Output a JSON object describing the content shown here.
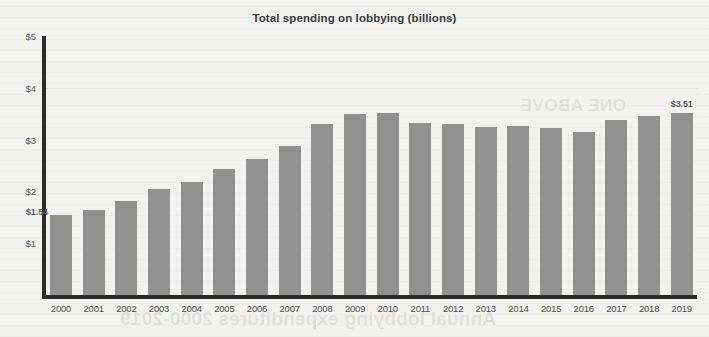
{
  "chart": {
    "title": "Total spending on lobbying (billions)",
    "background_color": "#f2f2f0",
    "bar_color": "#919191",
    "axis_color": "#2d2d2d",
    "label_color": "#5a5a5a"
  },
  "axes": {
    "y_ticks": [
      "$5",
      "$4",
      "$3",
      "$2",
      "$1"
    ],
    "x_ticks": [
      "2000",
      "2001",
      "2002",
      "2003",
      "2004",
      "2005",
      "2006",
      "2007",
      "2008",
      "2009",
      "2010",
      "2011",
      "2012",
      "2013",
      "2014",
      "2015",
      "2016",
      "2017",
      "2018",
      "2019"
    ]
  },
  "annotations": {
    "first_bar_label": "$1.54",
    "last_bar_label": "$3.51"
  },
  "background_text": {
    "heading": "Annual lobbying expenditures 2000-2019",
    "word": "ONE ABOVE"
  },
  "chart_data": {
    "type": "bar",
    "title": "Total spending on lobbying (billions)",
    "xlabel": "",
    "ylabel": "",
    "ylim": [
      0,
      5
    ],
    "yticks": [
      1,
      2,
      3,
      4,
      5
    ],
    "ytick_labels": [
      "$1",
      "$2",
      "$3",
      "$4",
      "$5"
    ],
    "grid": false,
    "legend": "none",
    "units": "billions of US dollars",
    "categories": [
      "2000",
      "2001",
      "2002",
      "2003",
      "2004",
      "2005",
      "2006",
      "2007",
      "2008",
      "2009",
      "2010",
      "2011",
      "2012",
      "2013",
      "2014",
      "2015",
      "2016",
      "2017",
      "2018",
      "2019"
    ],
    "values": [
      1.54,
      1.64,
      1.82,
      2.05,
      2.19,
      2.43,
      2.63,
      2.87,
      3.3,
      3.49,
      3.51,
      3.32,
      3.3,
      3.24,
      3.26,
      3.22,
      3.15,
      3.37,
      3.46,
      3.51
    ],
    "data_labels": [
      {
        "category": "2000",
        "text": "$1.54",
        "position": "left-of-bar-top"
      },
      {
        "category": "2019",
        "text": "$3.51",
        "position": "above-bar"
      }
    ]
  }
}
